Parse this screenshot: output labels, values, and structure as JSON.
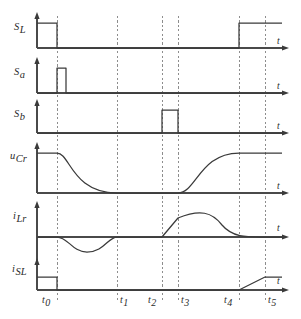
{
  "figure": {
    "type": "timing-waveform-diagram",
    "background_color": "#ffffff",
    "trace_color": "#3a3a3a",
    "grid_color": "#8d8d8d",
    "axis_color": "#4a4a4a",
    "time_axis_label": "t"
  },
  "time_markers": [
    {
      "id": "t0",
      "base": "t",
      "sub": "0",
      "x": 57
    },
    {
      "id": "t1",
      "base": "t",
      "sub": "1",
      "x": 117
    },
    {
      "id": "t2",
      "base": "t",
      "sub": "2",
      "x": 162
    },
    {
      "id": "t3",
      "base": "t",
      "sub": "3",
      "x": 178
    },
    {
      "id": "t4",
      "base": "t",
      "sub": "4",
      "x": 239
    },
    {
      "id": "t5",
      "base": "t",
      "sub": "5",
      "x": 265
    }
  ],
  "signals": [
    {
      "id": "SL",
      "base": "S",
      "sub": "L",
      "sub_italic": false,
      "kind": "switch-gate",
      "baseline_y": 48,
      "high_y": 23,
      "axis_top_y": 16,
      "axis_x": 37,
      "axis_end_x": 288,
      "label_x": 14,
      "label_y": 30,
      "t_label_x": 277,
      "t_label_y": 44,
      "segments": [
        {
          "type": "high",
          "from": 37,
          "to": 57
        },
        {
          "type": "low",
          "from": 57,
          "to": 239
        },
        {
          "type": "high",
          "from": 239,
          "to": 282
        }
      ]
    },
    {
      "id": "Sa",
      "base": "S",
      "sub": "a",
      "sub_italic": true,
      "kind": "switch-gate",
      "baseline_y": 93,
      "high_y": 68,
      "axis_top_y": 61,
      "axis_x": 37,
      "axis_end_x": 288,
      "label_x": 14,
      "label_y": 75,
      "t_label_x": 277,
      "t_label_y": 89,
      "segments": [
        {
          "type": "low",
          "from": 37,
          "to": 57
        },
        {
          "type": "high",
          "from": 57,
          "to": 66
        },
        {
          "type": "low",
          "from": 66,
          "to": 282
        }
      ]
    },
    {
      "id": "Sb",
      "base": "S",
      "sub": "b",
      "sub_italic": true,
      "kind": "switch-gate",
      "baseline_y": 133,
      "high_y": 110,
      "axis_top_y": 103,
      "axis_x": 37,
      "axis_end_x": 288,
      "label_x": 14,
      "label_y": 117,
      "t_label_x": 277,
      "t_label_y": 129,
      "segments": [
        {
          "type": "low",
          "from": 37,
          "to": 162
        },
        {
          "type": "high",
          "from": 162,
          "to": 178
        },
        {
          "type": "low",
          "from": 178,
          "to": 282
        }
      ]
    },
    {
      "id": "uCr",
      "base": "u",
      "sub": "Cr",
      "sub_italic": true,
      "kind": "capacitor-voltage",
      "baseline_y": 193,
      "high_y": 153,
      "axis_top_y": 146,
      "axis_x": 37,
      "axis_end_x": 288,
      "label_x": 10,
      "label_y": 159,
      "t_label_x": 277,
      "t_label_y": 189,
      "path": "M37,153 L57,153 C70,153 72,193 117,193 L178,193 C196,193 200,153 239,153 L282,153"
    },
    {
      "id": "iLr",
      "base": "i",
      "sub": "Lr",
      "sub_italic": true,
      "kind": "resonant-inductor-current",
      "baseline_y": 237,
      "axis_top_y": 205,
      "axis_bottom_y": 262,
      "axis_x": 37,
      "axis_end_x": 288,
      "label_x": 13,
      "label_y": 219,
      "t_label_x": 277,
      "t_label_y": 231,
      "peak_y": 213,
      "trough_y": 252,
      "path": "M37,237 L57,237 C68,237 72,252 87,252 C104,252 108,237 117,237 L162,237 L178,218 C200,209 212,212 222,225 C233,238 248,237 265,237 L282,237"
    },
    {
      "id": "iSL",
      "base": "i",
      "sub": "SL",
      "sub_italic": false,
      "kind": "switch-current",
      "baseline_y": 290,
      "high_y": 277,
      "axis_top_y": 262,
      "axis_x": 37,
      "axis_end_x": 288,
      "label_x": 12,
      "label_y": 272,
      "t_label_x": 277,
      "t_label_y": 284,
      "path": "M37,277 L57,277 L57,290 L239,290 L265,277 L282,277"
    }
  ],
  "dashed_gridlines": [
    {
      "marker": "t0",
      "x": 57,
      "y_from": 16,
      "y_to": 300
    },
    {
      "marker": "t1",
      "x": 117,
      "y_from": 16,
      "y_to": 300
    },
    {
      "marker": "t2",
      "x": 162,
      "y_from": 16,
      "y_to": 300
    },
    {
      "marker": "t3",
      "x": 178,
      "y_from": 16,
      "y_to": 300
    },
    {
      "marker": "t4",
      "x": 239,
      "y_from": 16,
      "y_to": 300
    },
    {
      "marker": "t5",
      "x": 265,
      "y_from": 16,
      "y_to": 300
    }
  ],
  "tick_labels": [
    {
      "base": "t",
      "sub": "0",
      "x": 42,
      "y": 303
    },
    {
      "base": "t",
      "sub": "1",
      "x": 120,
      "y": 303
    },
    {
      "base": "t",
      "sub": "2",
      "x": 148,
      "y": 303
    },
    {
      "base": "t",
      "sub": "3",
      "x": 181,
      "y": 303
    },
    {
      "base": "t",
      "sub": "4",
      "x": 224,
      "y": 303
    },
    {
      "base": "t",
      "sub": "5",
      "x": 268,
      "y": 303
    }
  ]
}
